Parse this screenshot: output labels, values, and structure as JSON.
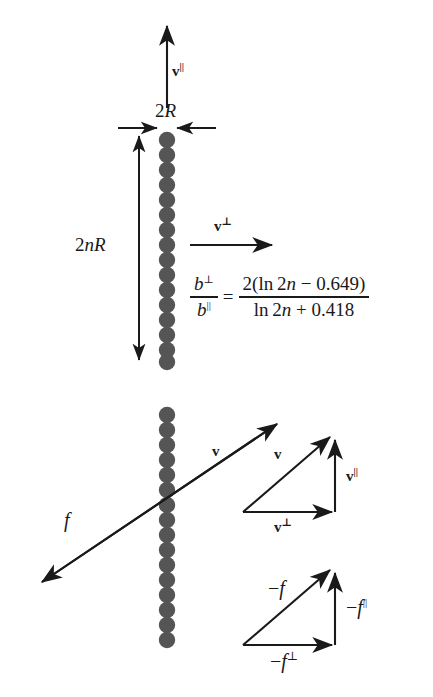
{
  "figure": {
    "bead_color": "#555555",
    "line_color": "#1a1a1a",
    "background": "#ffffff"
  },
  "top_panel": {
    "v_parallel_label": "v",
    "v_parallel_sup": "||",
    "v_perp_label": "v",
    "v_perp_sup": "⊥",
    "diameter_label_prefix": "2",
    "diameter_label_sym": "R",
    "length_label_prefix": "2",
    "length_label_var": "n",
    "length_label_sym": "R",
    "bead_count": 16
  },
  "equation": {
    "lhs_num_sym": "b",
    "lhs_num_sup": "⊥",
    "lhs_den_sym": "b",
    "lhs_den_sup": "||",
    "equals": "=",
    "rhs_numerator": "2(ln 2n − 0.649)",
    "rhs_denominator": "ln 2n + 0.418",
    "rhs_num_coeff": "2(ln 2",
    "rhs_num_var": "n",
    "rhs_num_tail": " − 0.649)",
    "rhs_den_head": "ln 2",
    "rhs_den_var": "n",
    "rhs_den_tail": " + 0.418",
    "plain": "b⊥/b|| = 2(ln 2n − 0.649) / (ln 2n + 0.418)"
  },
  "bottom_panel": {
    "bead_count": 16,
    "velocity_label": "v",
    "force_label": "f"
  },
  "velocity_triangle": {
    "hypotenuse_label": "v",
    "horizontal_label": "v",
    "horizontal_sup": "⊥",
    "vertical_label": "v",
    "vertical_sup": "||"
  },
  "force_triangle": {
    "hypotenuse_label": "−f",
    "hypotenuse_sign": "−",
    "hypotenuse_sym": "f",
    "horizontal_sym": "f",
    "horizontal_sup": "⊥",
    "vertical_sym": "f",
    "vertical_sup": "||"
  }
}
